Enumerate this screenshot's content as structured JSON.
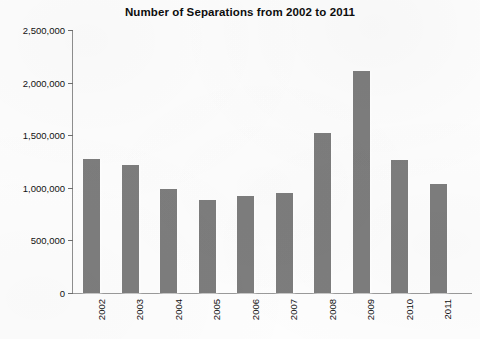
{
  "chart_data": {
    "type": "bar",
    "title": "Number of Separations from 2002 to 2011",
    "xlabel": "",
    "ylabel": "",
    "categories": [
      "2002",
      "2003",
      "2004",
      "2005",
      "2006",
      "2007",
      "2008",
      "2009",
      "2010",
      "2011"
    ],
    "values": [
      1270000,
      1215000,
      985000,
      880000,
      925000,
      955000,
      1520000,
      2110000,
      1265000,
      1040000
    ],
    "ylim": [
      0,
      2500000
    ],
    "yticks": [
      0,
      500000,
      1000000,
      1500000,
      2000000,
      2500000
    ],
    "ytick_labels": [
      "0",
      "500,000",
      "1,000,000",
      "1,500,000",
      "2,000,000",
      "2,500,000"
    ],
    "grid": false,
    "legend": null,
    "bar_color": "#7d7d7d",
    "axis_color": "#8f8f8f",
    "text_color": "#111111",
    "background": "#fdfdfd"
  }
}
